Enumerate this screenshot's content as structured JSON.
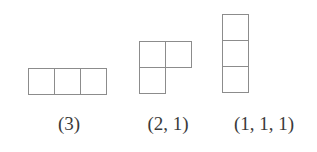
{
  "figure": {
    "background_color": "#ffffff",
    "cell_stroke_color": "#8c8c8c",
    "label_color": "#3a3a3a",
    "cell_size_px": 27
  },
  "diagrams": [
    {
      "id": "diagram-3",
      "label": "(3)",
      "partition": [
        3
      ],
      "rows": [
        3
      ],
      "total_cells": 3
    },
    {
      "id": "diagram-2-1",
      "label": "(2, 1)",
      "partition": [
        2,
        1
      ],
      "rows": [
        2,
        1
      ],
      "total_cells": 3
    },
    {
      "id": "diagram-1-1-1",
      "label": "(1, 1, 1)",
      "partition": [
        1,
        1,
        1
      ],
      "rows": [
        1,
        1,
        1
      ],
      "total_cells": 3
    }
  ]
}
